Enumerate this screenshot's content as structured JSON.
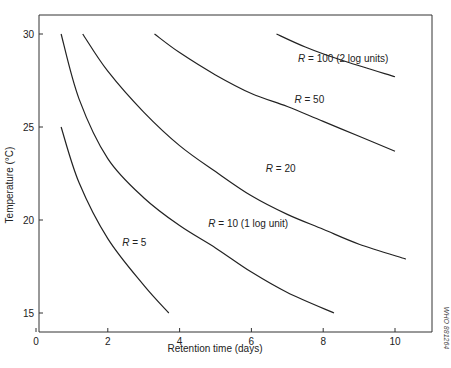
{
  "chart_data": {
    "type": "line",
    "title": "",
    "xlabel": "Retention time (days)",
    "ylabel": "Temperature (°C)",
    "xlim": [
      0,
      11
    ],
    "ylim": [
      14,
      31
    ],
    "xticks": [
      0,
      2,
      4,
      6,
      8,
      10
    ],
    "yticks": [
      15,
      20,
      25,
      30
    ],
    "grid": false,
    "legend": "inline labels",
    "series": [
      {
        "name": "R = 5",
        "label_pos": [
          2.4,
          18.6
        ],
        "points": [
          [
            0.7,
            25
          ],
          [
            1.2,
            22
          ],
          [
            2,
            19
          ],
          [
            3,
            16.5
          ],
          [
            3.7,
            15
          ]
        ]
      },
      {
        "name": "R = 10 (1 log unit)",
        "label_pos": [
          4.8,
          19.6
        ],
        "points": [
          [
            0.7,
            30
          ],
          [
            1.2,
            26.5
          ],
          [
            2,
            23.3
          ],
          [
            3,
            21.2
          ],
          [
            4,
            19.7
          ],
          [
            5,
            18.5
          ],
          [
            6,
            17.2
          ],
          [
            7,
            16.1
          ],
          [
            8.3,
            15
          ]
        ]
      },
      {
        "name": "R = 20",
        "label_pos": [
          6.4,
          22.6
        ],
        "points": [
          [
            1.3,
            30
          ],
          [
            2,
            28
          ],
          [
            3,
            25.8
          ],
          [
            4,
            24
          ],
          [
            5,
            22.6
          ],
          [
            6,
            21.3
          ],
          [
            7,
            20.3
          ],
          [
            8,
            19.5
          ],
          [
            9,
            18.7
          ],
          [
            10.3,
            17.9
          ]
        ]
      },
      {
        "name": "R = 50",
        "label_pos": [
          7.2,
          26.3
        ],
        "points": [
          [
            3.3,
            30
          ],
          [
            4,
            29
          ],
          [
            5,
            27.8
          ],
          [
            6,
            26.8
          ],
          [
            7,
            26.1
          ],
          [
            8,
            25.3
          ],
          [
            9,
            24.5
          ],
          [
            10,
            23.7
          ]
        ]
      },
      {
        "name": "R = 100 (2 log units)",
        "label_pos": [
          7.3,
          28.5
        ],
        "points": [
          [
            6.7,
            30
          ],
          [
            7.5,
            29.3
          ],
          [
            8.5,
            28.6
          ],
          [
            10,
            27.7
          ]
        ]
      }
    ]
  },
  "labels": {
    "x_axis_title": "Retention time (days)",
    "y_axis_title": "Temperature (°C)",
    "credit": "WHO 881264",
    "x_ticks": [
      "0",
      "2",
      "4",
      "6",
      "8",
      "10"
    ],
    "y_ticks": [
      "15",
      "20",
      "25",
      "30"
    ],
    "series_italic_prefix": "R",
    "series_suffixes": [
      " = 5",
      " = 10 (1 log unit)",
      " = 20",
      " = 50",
      " = 100 (2 log units)"
    ]
  }
}
